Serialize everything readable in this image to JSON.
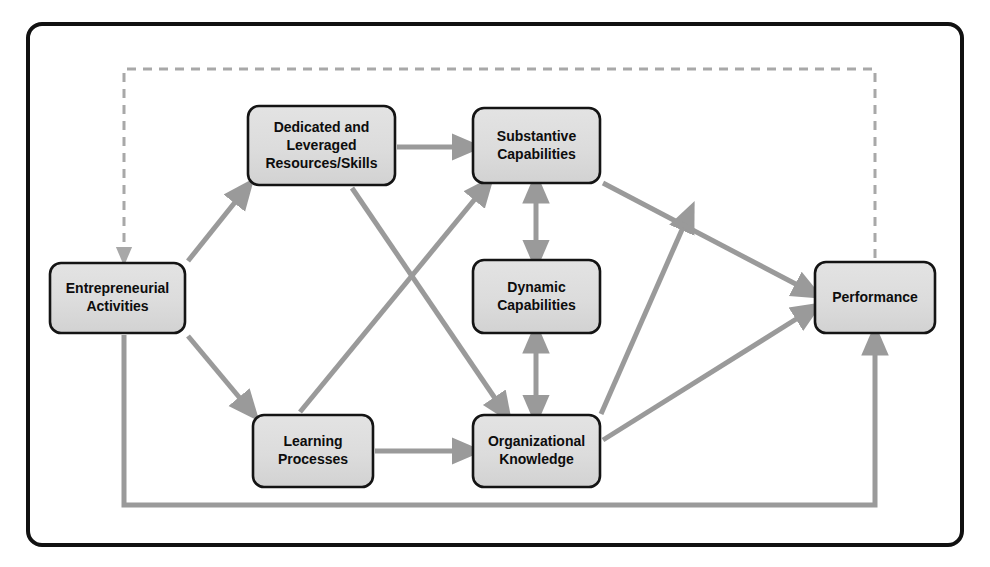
{
  "diagram": {
    "type": "flow-diagram",
    "colors": {
      "frame_border": "#111111",
      "node_fill": "#dcdcdc",
      "node_border": "#141414",
      "arrow": "#9a9a9a",
      "dashed_feedback": "#a8a8a8",
      "solid_feedback": "#a8a8a8",
      "label_text": "#0d0d0d",
      "background": "#ffffff"
    },
    "frame": {
      "x": 28,
      "y": 24,
      "width": 934,
      "height": 521,
      "corner_radius": 14,
      "stroke_width": 4
    },
    "nodes": [
      {
        "id": "entrepreneurial-activities",
        "label_lines": [
          "Entrepreneurial",
          "Activities"
        ],
        "x": 50,
        "y": 263,
        "width": 135,
        "height": 70,
        "font_size": 14
      },
      {
        "id": "dedicated-leveraged-resources",
        "label_lines": [
          "Dedicated and",
          "Leveraged",
          "Resources/Skills"
        ],
        "x": 248,
        "y": 106,
        "width": 147,
        "height": 79,
        "font_size": 14
      },
      {
        "id": "substantive-capabilities",
        "label_lines": [
          "Substantive",
          "Capabilities"
        ],
        "x": 473,
        "y": 108,
        "width": 127,
        "height": 75,
        "font_size": 14
      },
      {
        "id": "dynamic-capabilities",
        "label_lines": [
          "Dynamic",
          "Capabilities"
        ],
        "x": 473,
        "y": 260,
        "width": 127,
        "height": 73,
        "font_size": 14
      },
      {
        "id": "organizational-knowledge",
        "label_lines": [
          "Organizational",
          "Knowledge"
        ],
        "x": 473,
        "y": 415,
        "width": 127,
        "height": 72,
        "font_size": 14
      },
      {
        "id": "learning-processes",
        "label_lines": [
          "Learning",
          "Processes"
        ],
        "x": 253,
        "y": 415,
        "width": 120,
        "height": 72,
        "font_size": 14
      },
      {
        "id": "performance",
        "label_lines": [
          "Performance"
        ],
        "x": 815,
        "y": 262,
        "width": 120,
        "height": 71,
        "font_size": 14
      }
    ],
    "edges": [
      {
        "id": "ea-to-dedicated",
        "from": "entrepreneurial-activities",
        "to": "dedicated-leveraged-resources",
        "style": "solid",
        "arrowheads": "end",
        "path": "M 188 261 L 244 191"
      },
      {
        "id": "ea-to-learning",
        "from": "entrepreneurial-activities",
        "to": "learning-processes",
        "style": "solid",
        "arrowheads": "end",
        "path": "M 188 336 L 249 409"
      },
      {
        "id": "dedicated-to-substantive",
        "from": "dedicated-leveraged-resources",
        "to": "substantive-capabilities",
        "style": "solid",
        "arrowheads": "end",
        "path": "M 397 147 L 467 147"
      },
      {
        "id": "dedicated-to-organizational-knowledge",
        "from": "dedicated-leveraged-resources",
        "to": "organizational-knowledge",
        "style": "solid",
        "arrowheads": "end",
        "path": "M 352 188 L 503 410"
      },
      {
        "id": "learning-to-substantive",
        "from": "learning-processes",
        "to": "substantive-capabilities",
        "style": "solid",
        "arrowheads": "end",
        "path": "M 300 412 L 484 188"
      },
      {
        "id": "learning-to-organizational-knowledge",
        "from": "learning-processes",
        "to": "organizational-knowledge",
        "style": "solid",
        "arrowheads": "end",
        "path": "M 375 451 L 467 451"
      },
      {
        "id": "substantive-dynamic-bidirectional",
        "from": "substantive-capabilities",
        "to": "dynamic-capabilities",
        "style": "solid",
        "arrowheads": "both",
        "path": "M 536 188 L 536 255"
      },
      {
        "id": "dynamic-organizational-bidirectional",
        "from": "dynamic-capabilities",
        "to": "organizational-knowledge",
        "style": "solid",
        "arrowheads": "both",
        "path": "M 536 338 L 536 410"
      },
      {
        "id": "organizational-knowledge-to-substantive",
        "from": "organizational-knowledge",
        "to": "substantive-capabilities",
        "style": "solid",
        "arrowheads": "end",
        "path": "M 601 414 L 688 216"
      },
      {
        "id": "substantive-to-performance",
        "from": "substantive-capabilities",
        "to": "performance",
        "style": "solid",
        "arrowheads": "end",
        "path": "M 603 183 L 809 291"
      },
      {
        "id": "organizational-knowledge-to-performance",
        "from": "organizational-knowledge",
        "to": "performance",
        "style": "solid",
        "arrowheads": "end",
        "path": "M 603 440 L 809 311"
      },
      {
        "id": "performance-feedback-to-entrepreneurial-activities",
        "from": "performance",
        "to": "entrepreneurial-activities",
        "style": "dashed",
        "arrowheads": "end",
        "path": "M 875 258 L 875 69 L 124 69 L 124 256"
      },
      {
        "id": "entrepreneurial-activities-bottom-to-performance",
        "from": "entrepreneurial-activities",
        "to": "performance",
        "style": "solid",
        "arrowheads": "end",
        "path": "M 124 335 L 124 505 L 875 505 L 875 340"
      }
    ]
  }
}
